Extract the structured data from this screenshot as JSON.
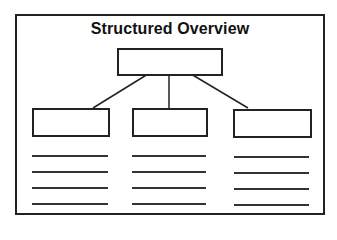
{
  "diagram": {
    "title": "Structured Overview",
    "type": "hierarchy",
    "root_box": {
      "label": ""
    },
    "child_boxes": [
      {
        "label": "",
        "lines": [
          "",
          "",
          "",
          ""
        ]
      },
      {
        "label": "",
        "lines": [
          "",
          "",
          "",
          ""
        ]
      },
      {
        "label": "",
        "lines": [
          "",
          "",
          "",
          ""
        ]
      }
    ],
    "colors": {
      "stroke": "#222222",
      "background": "#ffffff"
    }
  }
}
